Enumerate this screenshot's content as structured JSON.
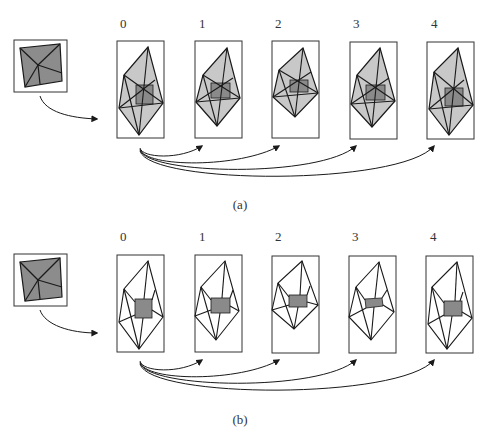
{
  "figure": {
    "panels": [
      {
        "caption": "(a)",
        "frame_labels": [
          "0",
          "1",
          "2",
          "3",
          "4"
        ],
        "description": "Source texture patch mapped onto triangulated mesh; all triangles shaded gray, inner square darker"
      },
      {
        "caption": "(b)",
        "frame_labels": [
          "0",
          "1",
          "2",
          "3",
          "4"
        ],
        "description": "Source texture patch mapped only onto inner quad; surrounding triangles unshaded"
      }
    ],
    "colors": {
      "mesh_fill": "#c8c8c8",
      "inner_fill": "#8a8a8a",
      "source_fill": "#8c8c8c",
      "line": "#1a1a1a"
    }
  }
}
